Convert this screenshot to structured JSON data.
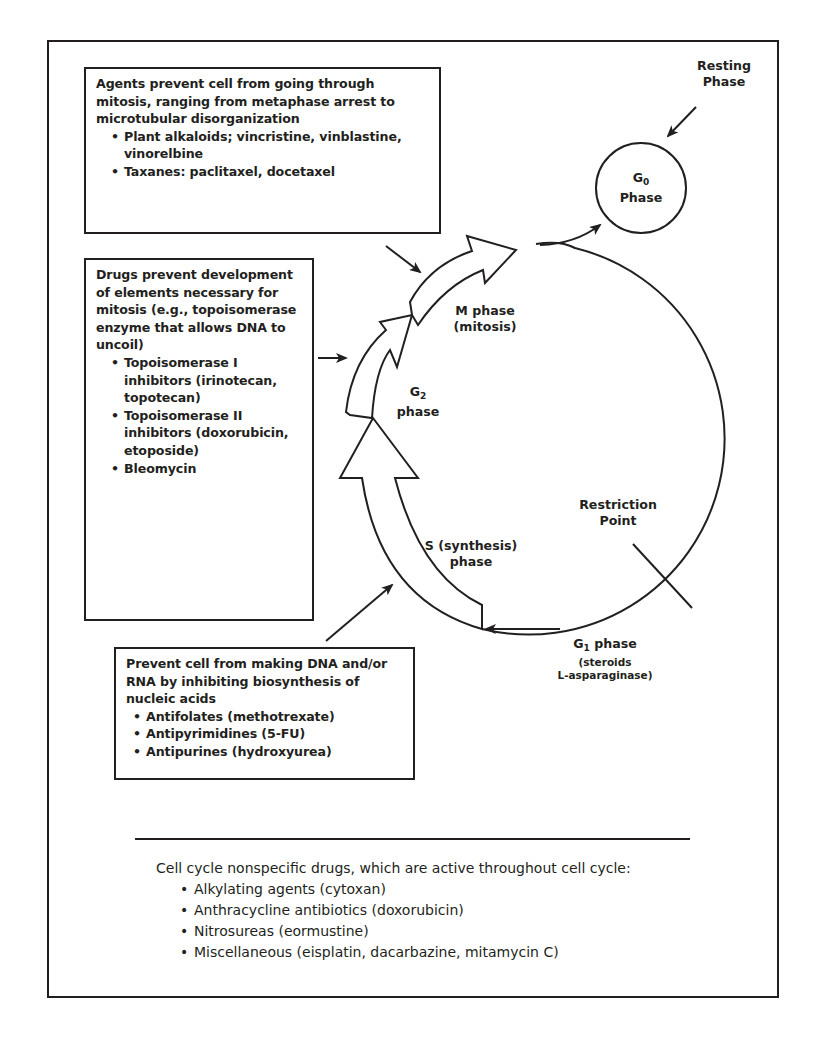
{
  "boxes": {
    "mitosis_agents": {
      "intro": "Agents prevent cell from going through mitosis, ranging from metaphase arrest to microtubular disorganization",
      "items": [
        "Plant alkaloids; vincristine, vinblastine, vinorelbine",
        "Taxanes: paclitaxel, docetaxel"
      ]
    },
    "topoisomerase_agents": {
      "intro": "Drugs prevent development of elements necessary for mitosis (e.g., topoisomerase enzyme that allows DNA to uncoil)",
      "items": [
        "Topoisomerase I inhibitors (irinotecan, topotecan)",
        "Topoisomerase II inhibitors (doxorubicin, etoposide)",
        "Bleomycin"
      ]
    },
    "dna_synthesis_agents": {
      "intro": "Prevent cell from making DNA and/or RNA by inhibiting biosynthesis of nucleic acids",
      "items": [
        "Antifolates (methotrexate)",
        "Antipyrimidines (5-FU)",
        "Antipurines (hydroxyurea)"
      ]
    }
  },
  "cycle": {
    "resting_label_1": "Resting",
    "resting_label_2": "Phase",
    "g0_letter": "G",
    "g0_sub": "0",
    "g0_word": "Phase",
    "m_phase_1": "M phase",
    "m_phase_2": "(mitosis)",
    "g2_letter": "G",
    "g2_sub": "2",
    "g2_word": "phase",
    "s_phase_1": "S (synthesis)",
    "s_phase_2": "phase",
    "restriction_1": "Restriction",
    "restriction_2": "Point",
    "g1_letter": "G",
    "g1_sub": "1",
    "g1_word": " phase",
    "g1_note_1": "(steroids",
    "g1_note_2": "L-asparaginase)"
  },
  "nonspecific": {
    "intro": "Cell cycle nonspecific drugs, which are active throughout cell cycle:",
    "items": [
      "Alkylating agents (cytoxan)",
      "Anthracycline antibiotics (doxorubicin)",
      "Nitrosureas (eormustine)",
      "Miscellaneous (eisplatin, dacarbazine, mitamycin C)"
    ]
  },
  "colors": {
    "ink": "#231f20",
    "background": "#ffffff"
  }
}
